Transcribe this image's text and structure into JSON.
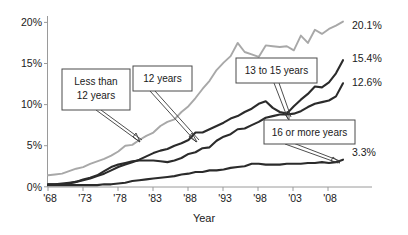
{
  "chart_data": {
    "type": "line",
    "title": "",
    "xlabel": "Year",
    "ylabel": "",
    "xlim": [
      1968,
      2010
    ],
    "ylim": [
      0,
      21
    ],
    "grid": false,
    "legend_position": "inline-callouts",
    "xtick_labels": [
      "'68",
      "'73",
      "'78",
      "'83",
      "'88",
      "'93",
      "'98",
      "'03",
      "'08"
    ],
    "xtick_values": [
      1968,
      1973,
      1978,
      1983,
      1988,
      1993,
      1998,
      2003,
      2008
    ],
    "ytick_labels": [
      "0%",
      "5%",
      "10%",
      "15%",
      "20%"
    ],
    "ytick_values": [
      0,
      5,
      10,
      15,
      20
    ],
    "x": [
      1968,
      1969,
      1970,
      1971,
      1972,
      1973,
      1974,
      1975,
      1976,
      1977,
      1978,
      1979,
      1980,
      1981,
      1982,
      1983,
      1984,
      1985,
      1986,
      1987,
      1988,
      1989,
      1990,
      1991,
      1992,
      1993,
      1994,
      1995,
      1996,
      1997,
      1998,
      1999,
      2000,
      2001,
      2002,
      2003,
      2004,
      2005,
      2006,
      2007,
      2008,
      2009,
      2010
    ],
    "series": [
      {
        "name": "Less than 12 years",
        "color": "#a8a8a8",
        "end_label": "20.1%",
        "end_value": 20.1,
        "values": [
          1.4,
          1.5,
          1.6,
          1.9,
          2.2,
          2.4,
          2.8,
          3.1,
          3.4,
          3.8,
          4.3,
          5.0,
          5.1,
          5.7,
          6.2,
          6.6,
          7.4,
          7.9,
          8.2,
          9.1,
          9.8,
          10.8,
          11.9,
          12.9,
          14.2,
          15.1,
          15.9,
          17.5,
          16.4,
          16.1,
          15.8,
          17.2,
          17.1,
          17.0,
          17.1,
          16.6,
          18.4,
          17.5,
          19.1,
          18.6,
          19.2,
          19.6,
          20.1
        ]
      },
      {
        "name": "12 years",
        "color": "#2b2b2b",
        "end_label": "15.4%",
        "end_value": 15.4,
        "values": [
          0.3,
          0.3,
          0.3,
          0.4,
          0.6,
          0.8,
          1.0,
          1.3,
          1.6,
          2.0,
          2.4,
          2.7,
          3.0,
          3.3,
          3.7,
          4.1,
          4.4,
          4.6,
          5.0,
          5.3,
          5.7,
          6.6,
          6.6,
          7.0,
          7.4,
          7.8,
          8.3,
          8.6,
          9.1,
          9.5,
          10.1,
          10.4,
          9.6,
          9.1,
          8.9,
          9.8,
          10.6,
          11.3,
          12.2,
          12.1,
          12.7,
          13.8,
          15.4
        ]
      },
      {
        "name": "13 to 15 years",
        "color": "#2b2b2b",
        "end_label": "12.6%",
        "end_value": 12.6,
        "values": [
          0.3,
          0.3,
          0.4,
          0.5,
          0.6,
          0.9,
          1.1,
          1.4,
          1.9,
          2.4,
          2.7,
          2.9,
          3.1,
          3.2,
          3.2,
          3.2,
          3.1,
          3.0,
          3.2,
          3.5,
          4.0,
          4.2,
          4.7,
          4.8,
          5.6,
          6.1,
          6.4,
          7.0,
          7.1,
          7.5,
          7.9,
          8.4,
          8.6,
          8.8,
          8.8,
          8.9,
          9.2,
          9.7,
          10.1,
          10.3,
          10.5,
          11.0,
          12.6
        ]
      },
      {
        "name": "16 or more years",
        "color": "#2b2b2b",
        "end_label": "3.3%",
        "end_value": 3.3,
        "values": [
          0.2,
          0.2,
          0.2,
          0.2,
          0.2,
          0.2,
          0.2,
          0.2,
          0.3,
          0.3,
          0.4,
          0.5,
          0.7,
          0.8,
          0.9,
          1.0,
          1.1,
          1.2,
          1.3,
          1.5,
          1.6,
          1.8,
          1.8,
          2.0,
          2.0,
          2.1,
          2.3,
          2.4,
          2.5,
          2.8,
          2.8,
          2.7,
          2.7,
          2.7,
          2.8,
          2.8,
          2.8,
          2.9,
          2.9,
          3.0,
          2.9,
          3.0,
          3.3
        ]
      }
    ],
    "annotations": [
      {
        "name": "callout-less-than-12",
        "label": "Less than\n12 years",
        "lines": [
          "Less than",
          "12 years"
        ]
      },
      {
        "name": "callout-12-years",
        "label": "12 years",
        "lines": [
          "12 years"
        ]
      },
      {
        "name": "callout-13-to-15",
        "label": "13 to 15 years",
        "lines": [
          "13 to 15 years"
        ]
      },
      {
        "name": "callout-16-or-more",
        "label": "16 or more years",
        "lines": [
          "16 or more years"
        ]
      }
    ]
  }
}
